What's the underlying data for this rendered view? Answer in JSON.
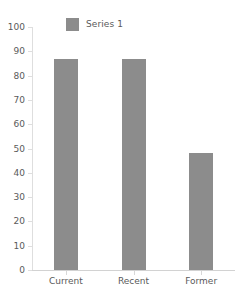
{
  "chart_data": {
    "type": "bar",
    "title": "",
    "subtitle": "",
    "xlabel": "",
    "ylabel": "",
    "categories": [
      "Current",
      "Recent",
      "Former"
    ],
    "values": [
      87,
      87,
      48
    ],
    "series": [
      {
        "name": "Series 1",
        "values": [
          87,
          87,
          48
        ],
        "color": "#8c8c8c"
      }
    ],
    "ylim": [
      0,
      100
    ],
    "y_ticks": [
      0,
      10,
      20,
      30,
      40,
      50,
      60,
      70,
      80,
      90,
      100
    ],
    "y_tick_labels": [
      "0",
      "10",
      "20",
      "30",
      "40",
      "50",
      "60",
      "70",
      "80",
      "90",
      "100"
    ],
    "grid": false,
    "legend_position": "top-left"
  },
  "legend": {
    "entries": [
      {
        "label": "Series 1",
        "color": "#8c8c8c",
        "swatch": "legend-swatch-icon"
      }
    ]
  },
  "axes": {
    "y": {
      "labels": [
        "100",
        "90",
        "80",
        "70",
        "60",
        "50",
        "40",
        "30",
        "20",
        "10",
        "0"
      ],
      "values": [
        100,
        90,
        80,
        70,
        60,
        50,
        40,
        30,
        20,
        10,
        0
      ],
      "min": 0,
      "max": 100
    },
    "x": {
      "labels": [
        "Current",
        "Recent",
        "Former"
      ]
    }
  },
  "colors": {
    "bar": "#8c8c8c",
    "text": "#5a5a5a",
    "axis_line": "#dedede",
    "baseline": "#d2d2d2",
    "background": "#ffffff"
  }
}
